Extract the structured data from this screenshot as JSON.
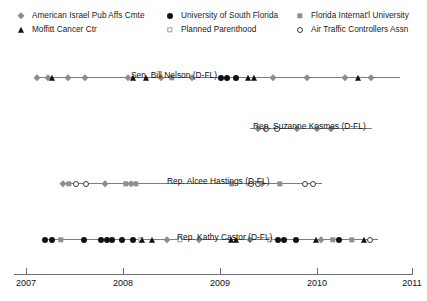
{
  "legend": {
    "position": "top",
    "items": [
      {
        "label": "American Israel Pub Affs Cmte",
        "marker": "gray-diamond-icon",
        "col": 0,
        "row": 0,
        "x": 14,
        "y": 4
      },
      {
        "label": "Moffitt Cancer Ctr",
        "marker": "black-triangle-icon",
        "col": 0,
        "row": 1,
        "x": 14,
        "y": 18
      },
      {
        "label": "University of South Florida",
        "marker": "black-circle-icon",
        "col": 1,
        "row": 0,
        "x": 163,
        "y": 4
      },
      {
        "label": "Planned Parenthood",
        "marker": "open-square-icon",
        "col": 1,
        "row": 1,
        "x": 163,
        "y": 18
      },
      {
        "label": "Florida Internat'l University",
        "marker": "gray-square-icon",
        "col": 2,
        "row": 0,
        "x": 293,
        "y": 4
      },
      {
        "label": "Air Traffic Controllers Assn",
        "marker": "open-circle-icon",
        "col": 2,
        "row": 1,
        "x": 293,
        "y": 18
      }
    ]
  },
  "axis": {
    "ticks": [
      {
        "label": "2007",
        "x": 26
      },
      {
        "label": "2008",
        "x": 123
      },
      {
        "label": "2009",
        "x": 220
      },
      {
        "label": "2010",
        "x": 317
      },
      {
        "label": "2011",
        "x": 412
      }
    ],
    "range": [
      2007,
      2011
    ],
    "baseline_y": 274
  },
  "colors": {
    "gray_marker": "#8c8c8c",
    "black_marker": "#111111",
    "line": "#7d7d7d",
    "axis": "#6f6f6f",
    "text": "#111111",
    "background": "#ffffff"
  },
  "chart_data": {
    "type": "scatter",
    "title": "",
    "xlabel": "",
    "ylabel": "",
    "xlim": [
      2007,
      2011
    ],
    "grid": false,
    "legend_position": "top",
    "marker_legend": {
      "gray-diamond-icon": "American Israel Pub Affs Cmte",
      "black-triangle-icon": "Moffitt Cancer Ctr",
      "black-circle-icon": "University of South Florida",
      "open-square-icon": "Planned Parenthood",
      "gray-square-icon": "Florida Internat'l University",
      "open-circle-icon": "Air Traffic Controllers Assn"
    },
    "series": [
      {
        "name": "Sen. Bill Nelson (D-FL)",
        "label": "Sen. Bill Nelson (D-FL)",
        "row_top": 22,
        "label_x": 131,
        "label_y": 26,
        "line_x0": 34,
        "line_x1": 400,
        "points": [
          {
            "x": 37,
            "marker": "gray-diamond-icon"
          },
          {
            "x": 48,
            "marker": "gray-diamond-icon"
          },
          {
            "x": 52,
            "marker": "black-triangle-icon"
          },
          {
            "x": 68,
            "marker": "gray-diamond-icon"
          },
          {
            "x": 85,
            "marker": "gray-diamond-icon"
          },
          {
            "x": 128,
            "marker": "gray-diamond-icon"
          },
          {
            "x": 133,
            "marker": "black-triangle-icon"
          },
          {
            "x": 146,
            "marker": "black-triangle-icon"
          },
          {
            "x": 161,
            "marker": "gray-diamond-icon"
          },
          {
            "x": 172,
            "marker": "gray-square-icon"
          },
          {
            "x": 192,
            "marker": "gray-diamond-icon"
          },
          {
            "x": 221,
            "marker": "black-circle-icon"
          },
          {
            "x": 227,
            "marker": "black-circle-icon"
          },
          {
            "x": 236,
            "marker": "black-circle-icon"
          },
          {
            "x": 248,
            "marker": "black-triangle-icon"
          },
          {
            "x": 254,
            "marker": "black-triangle-icon"
          },
          {
            "x": 273,
            "marker": "gray-diamond-icon"
          },
          {
            "x": 307,
            "marker": "gray-diamond-icon"
          },
          {
            "x": 345,
            "marker": "gray-diamond-icon"
          },
          {
            "x": 358,
            "marker": "black-triangle-icon"
          },
          {
            "x": 371,
            "marker": "gray-diamond-icon"
          }
        ]
      },
      {
        "name": "Rep. Suzanne Kosmas (D-FL)",
        "label": "Rep. Suzanne Kosmas (D-FL)",
        "row_top": 73,
        "label_x": 253,
        "label_y": 77,
        "line_x0": 250,
        "line_x1": 372,
        "points": [
          {
            "x": 258,
            "marker": "gray-diamond-icon"
          },
          {
            "x": 266,
            "marker": "open-circle-icon"
          },
          {
            "x": 277,
            "marker": "open-circle-icon"
          },
          {
            "x": 297,
            "marker": "gray-diamond-icon"
          },
          {
            "x": 317,
            "marker": "gray-diamond-icon"
          },
          {
            "x": 331,
            "marker": "gray-diamond-icon"
          }
        ]
      },
      {
        "name": "Rep. Alcee Hastings (D-FL)",
        "label": "Rep. Alcee Hastings (D-FL)",
        "row_top": 128,
        "label_x": 167,
        "label_y": 132,
        "line_x0": 60,
        "line_x1": 322,
        "points": [
          {
            "x": 63,
            "marker": "gray-diamond-icon"
          },
          {
            "x": 69,
            "marker": "gray-square-icon"
          },
          {
            "x": 76,
            "marker": "open-circle-icon"
          },
          {
            "x": 86,
            "marker": "open-circle-icon"
          },
          {
            "x": 105,
            "marker": "gray-diamond-icon"
          },
          {
            "x": 126,
            "marker": "gray-square-icon"
          },
          {
            "x": 131,
            "marker": "gray-diamond-icon"
          },
          {
            "x": 136,
            "marker": "gray-square-icon"
          },
          {
            "x": 232,
            "marker": "gray-square-icon"
          },
          {
            "x": 251,
            "marker": "open-circle-icon"
          },
          {
            "x": 258,
            "marker": "open-circle-icon"
          },
          {
            "x": 262,
            "marker": "gray-diamond-icon"
          },
          {
            "x": 280,
            "marker": "gray-square-icon"
          },
          {
            "x": 305,
            "marker": "open-circle-icon"
          },
          {
            "x": 313,
            "marker": "open-circle-icon"
          }
        ]
      },
      {
        "name": "Rep. Kathy Castor (D-FL)",
        "label": "Rep. Kathy Castor (D-FL)",
        "row_top": 184,
        "label_x": 177,
        "label_y": 188,
        "line_x0": 42,
        "line_x1": 378,
        "points": [
          {
            "x": 45,
            "marker": "black-circle-icon"
          },
          {
            "x": 52,
            "marker": "black-circle-icon"
          },
          {
            "x": 61,
            "marker": "gray-square-icon"
          },
          {
            "x": 84,
            "marker": "black-circle-icon"
          },
          {
            "x": 101,
            "marker": "black-circle-icon"
          },
          {
            "x": 107,
            "marker": "black-circle-icon"
          },
          {
            "x": 112,
            "marker": "black-circle-icon"
          },
          {
            "x": 122,
            "marker": "black-circle-icon"
          },
          {
            "x": 133,
            "marker": "black-circle-icon"
          },
          {
            "x": 141,
            "marker": "open-square-icon"
          },
          {
            "x": 142,
            "marker": "black-triangle-icon"
          },
          {
            "x": 152,
            "marker": "black-triangle-icon"
          },
          {
            "x": 167,
            "marker": "gray-diamond-icon"
          },
          {
            "x": 180,
            "marker": "open-square-icon"
          },
          {
            "x": 199,
            "marker": "gray-diamond-icon"
          },
          {
            "x": 231,
            "marker": "black-triangle-icon"
          },
          {
            "x": 236,
            "marker": "black-triangle-icon"
          },
          {
            "x": 250,
            "marker": "gray-diamond-icon"
          },
          {
            "x": 270,
            "marker": "open-square-icon"
          },
          {
            "x": 278,
            "marker": "black-circle-icon"
          },
          {
            "x": 284,
            "marker": "black-circle-icon"
          },
          {
            "x": 296,
            "marker": "black-circle-icon"
          },
          {
            "x": 316,
            "marker": "black-triangle-icon"
          },
          {
            "x": 321,
            "marker": "gray-diamond-icon"
          },
          {
            "x": 333,
            "marker": "gray-square-icon"
          },
          {
            "x": 339,
            "marker": "black-circle-icon"
          },
          {
            "x": 352,
            "marker": "gray-square-icon"
          },
          {
            "x": 364,
            "marker": "black-triangle-icon"
          },
          {
            "x": 370,
            "marker": "open-circle-icon"
          }
        ]
      }
    ]
  }
}
